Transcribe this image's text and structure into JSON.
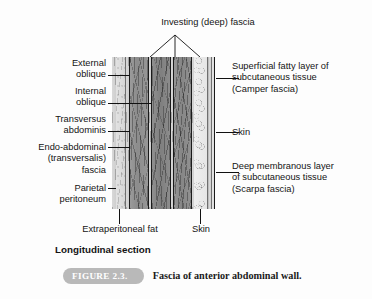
{
  "figure": {
    "title_top": "Investing (deep) fascia",
    "section_label": "Longitudinal section",
    "badge": "FIGURE 2.3.",
    "caption": "Fascia of anterior abdominal wall.",
    "colors": {
      "badge_fill": "#b9b9b9",
      "badge_text": "#ffffff",
      "line": "#111111",
      "background": "#fdfdfd",
      "muscle_gray": "#8c8c8c",
      "fat_gray": "#e8e8e8"
    }
  },
  "labels_left": [
    {
      "id": "external-oblique",
      "text": "External\noblique"
    },
    {
      "id": "internal-oblique",
      "text": "Internal\noblique"
    },
    {
      "id": "transversus-abdominis",
      "text": "Transversus\nabdominis"
    },
    {
      "id": "endo-abdominal-fascia",
      "text": "Endo-abdominal\n(transversalis)\nfascia"
    },
    {
      "id": "parietal-peritoneum",
      "text": "Parietal\nperitoneum"
    }
  ],
  "labels_right": [
    {
      "id": "camper-fascia",
      "text": "Superficial fatty layer of\nsubcutaneous tissue\n(Camper fascia)"
    },
    {
      "id": "skin-right",
      "text": "Skin"
    },
    {
      "id": "scarpa-fascia",
      "text": "Deep membranous layer\nof subcutaneous tissue\n(Scarpa fascia)"
    }
  ],
  "labels_bottom": [
    {
      "id": "extraperitoneal-fat",
      "text": "Extraperitoneal fat"
    },
    {
      "id": "skin-bottom",
      "text": "Skin"
    }
  ],
  "layers": [
    {
      "id": "parietal-peritoneum-band",
      "name": "Parietal peritoneum"
    },
    {
      "id": "extraperitoneal-fat-band",
      "name": "Extraperitoneal fat"
    },
    {
      "id": "transversalis-fascia-band",
      "name": "Endo-abdominal (transversalis) fascia"
    },
    {
      "id": "transversus-abdominis-band",
      "name": "Transversus abdominis"
    },
    {
      "id": "internal-oblique-band",
      "name": "Internal oblique"
    },
    {
      "id": "external-oblique-band",
      "name": "External oblique"
    },
    {
      "id": "investing-fascia-band",
      "name": "Investing (deep) fascia"
    },
    {
      "id": "camper-fascia-band",
      "name": "Superficial fatty layer (Camper fascia)"
    },
    {
      "id": "scarpa-fascia-band",
      "name": "Deep membranous layer (Scarpa fascia)"
    },
    {
      "id": "skin-band",
      "name": "Skin"
    }
  ]
}
